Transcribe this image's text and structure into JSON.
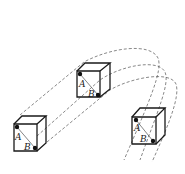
{
  "figure": {
    "colors": {
      "line": "#1a1a1a",
      "dashed": "#555555",
      "background": "#ffffff"
    },
    "cubes": [
      {
        "id": "left",
        "label_a": "A",
        "label_b": "B"
      },
      {
        "id": "middle",
        "label_a": "A",
        "label_b": "B"
      },
      {
        "id": "right",
        "label_a": "A",
        "label_b": "B"
      }
    ]
  }
}
